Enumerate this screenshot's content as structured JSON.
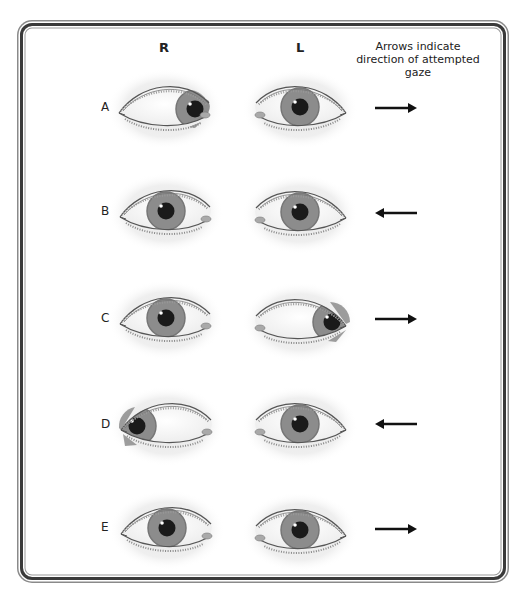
{
  "headers": {
    "right": "R",
    "left": "L",
    "note": "Arrows indicate direction of attempted gaze"
  },
  "rows": [
    {
      "label": "A",
      "gaze": "right",
      "right_eye": "abducted-lateral-restricted",
      "left_eye": "central"
    },
    {
      "label": "B",
      "gaze": "left",
      "right_eye": "central",
      "left_eye": "central"
    },
    {
      "label": "C",
      "gaze": "right",
      "right_eye": "central",
      "left_eye": "deviated-lateral"
    },
    {
      "label": "D",
      "gaze": "left",
      "right_eye": "deviated-lateral",
      "left_eye": "central"
    },
    {
      "label": "E",
      "gaze": "right",
      "right_eye": "central",
      "left_eye": "central"
    }
  ],
  "colors": {
    "iris": "#8c8c8c",
    "iris_rim": "#6e6e6e",
    "pupil": "#1a1a1a",
    "lid_line": "#555555",
    "shadow": "#e9e9e9",
    "arrow": "#111111",
    "frame": "#3a3a3a"
  }
}
